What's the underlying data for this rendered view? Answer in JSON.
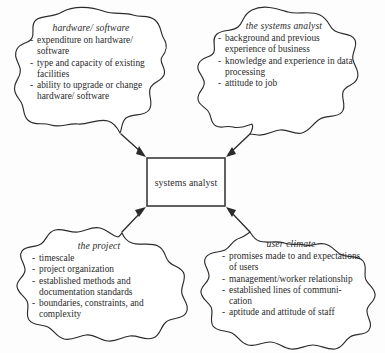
{
  "figure": {
    "center": {
      "label": "systems analyst"
    },
    "blobs": [
      {
        "id": "hardware-software",
        "title": "hardware/ software",
        "items": [
          "expenditure on hardware/ software",
          "type and capacity of existing facilities",
          "ability to upgrade or change hardware/ software"
        ]
      },
      {
        "id": "systems-analyst",
        "title": "the systems analyst",
        "items": [
          "background and previous experience of business",
          "knowledge and experience in data processing",
          "attitude to job"
        ]
      },
      {
        "id": "the-project",
        "title": "the project",
        "items": [
          "timescale",
          "project organization",
          "established methods and documentation standards",
          "boundaries, constraints, and complexity"
        ]
      },
      {
        "id": "user-climate",
        "title": "user climate",
        "items": [
          "promises made to and expectations of users",
          "management/worker relationship",
          "established lines of communi- cation",
          "aptitude and attitude of staff"
        ]
      }
    ],
    "bullet_marker": "-",
    "colors": {
      "ink": "#2b2b2b",
      "background": "#fdfdfd",
      "box_stroke": "#3a3a3a"
    }
  }
}
